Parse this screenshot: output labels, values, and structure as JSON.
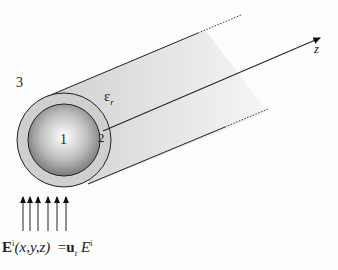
{
  "diagram": {
    "labels": {
      "region_outer": "3",
      "region_core": "1",
      "region_coating": "2",
      "permittivity_eps": "ε",
      "permittivity_sub": "r",
      "axis": "z"
    },
    "formula": {
      "lhs_E": "E",
      "lhs_sup": "i",
      "lhs_args": "(x,y,z)",
      "eq": "=",
      "rhs_u": "u",
      "rhs_sub": "t",
      "rhs_E": "E",
      "rhs_sup": "i"
    },
    "colors": {
      "coating": "#d2d2d2",
      "core_light": "#ffffff",
      "core_dark": "#6e6e6e",
      "line": "#222222"
    },
    "incident_arrow_count": 6
  }
}
